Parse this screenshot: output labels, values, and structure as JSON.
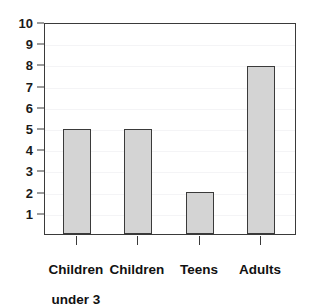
{
  "chart_data": {
    "type": "bar",
    "title": "",
    "subtitle": "",
    "xlabel": "",
    "ylabel": "",
    "categories": [
      "Children under 3",
      "Children",
      "Teens",
      "Adults"
    ],
    "category_lines": [
      [
        "Children",
        "under 3"
      ],
      [
        "Children"
      ],
      [
        "Teens"
      ],
      [
        "Adults"
      ]
    ],
    "values": [
      5,
      5,
      2,
      8
    ],
    "ylim": [
      0,
      10
    ],
    "y_ticks": [
      1,
      2,
      3,
      4,
      5,
      6,
      7,
      8,
      9,
      10
    ],
    "y_tick_labels": [
      "1",
      "2",
      "3",
      "4",
      "5",
      "6",
      "7",
      "8",
      "9",
      "10"
    ],
    "grid": true,
    "grid_orientation": "horizontal",
    "legend": false,
    "legend_position": "none",
    "annotations": []
  },
  "style": {
    "bar_fill": "#d4d4d4",
    "bar_border": "#3a3a3a",
    "axis_color": "#3a3a3a",
    "grid_color": "#f4f4f6",
    "text_color": "#111111",
    "background": "#ffffff"
  },
  "axis": {
    "y_tick_labels": {
      "t10": "10",
      "t9": "9",
      "t8": "8",
      "t7": "7",
      "t6": "6",
      "t5": "5",
      "t4": "4",
      "t3": "3",
      "t2": "2",
      "t1": "1"
    },
    "x_tick_labels": {
      "c0_line1": "Children",
      "c0_line2": "under 3",
      "c1_line1": "Children",
      "c2_line1": "Teens",
      "c3_line1": "Adults"
    }
  }
}
